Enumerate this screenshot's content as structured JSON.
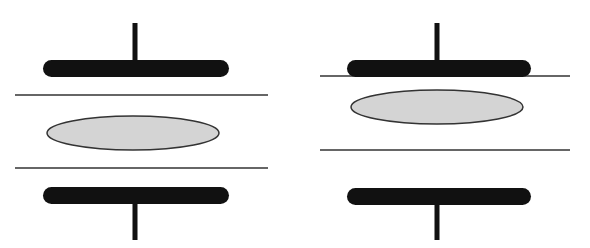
{
  "diagram": {
    "width": 590,
    "height": 248,
    "colors": {
      "background": "#ffffff",
      "electrode": "#111111",
      "line": "#333333",
      "ellipse_fill": "#d4d4d4",
      "ellipse_stroke": "#333333"
    },
    "panels": [
      {
        "id": "left",
        "top_stem": {
          "x": 135,
          "y1": 23,
          "y2": 62,
          "width": 5
        },
        "top_plate": {
          "x": 43,
          "y": 60,
          "w": 186,
          "h": 17
        },
        "upper_line": {
          "x1": 15,
          "x2": 268,
          "y": 95
        },
        "ellipse": {
          "cx": 133,
          "cy": 133,
          "rx": 86,
          "ry": 17
        },
        "lower_line": {
          "x1": 15,
          "x2": 268,
          "y": 168
        },
        "bottom_plate": {
          "x": 43,
          "y": 187,
          "w": 186,
          "h": 17
        },
        "bottom_stem": {
          "x": 135,
          "y1": 202,
          "y2": 240,
          "width": 5
        }
      },
      {
        "id": "right",
        "top_stem": {
          "x": 437,
          "y1": 23,
          "y2": 62,
          "width": 5
        },
        "top_plate": {
          "x": 347,
          "y": 60,
          "w": 184,
          "h": 17
        },
        "upper_line": {
          "x1": 320,
          "x2": 570,
          "y": 76
        },
        "ellipse": {
          "cx": 437,
          "cy": 107,
          "rx": 86,
          "ry": 17
        },
        "lower_line": {
          "x1": 320,
          "x2": 570,
          "y": 150
        },
        "bottom_plate": {
          "x": 347,
          "y": 188,
          "w": 184,
          "h": 17
        },
        "bottom_stem": {
          "x": 437,
          "y1": 203,
          "y2": 240,
          "width": 5
        }
      }
    ]
  }
}
